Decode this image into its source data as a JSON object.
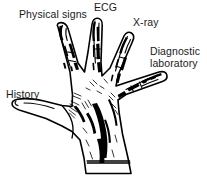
{
  "figure": {
    "name": "diagnostic-hand-diagram",
    "width": 207,
    "height": 176,
    "background_color": "#ffffff",
    "ink_color": "#000000",
    "text_color": "#1a1a1a"
  },
  "labels": [
    {
      "id": "physical-signs",
      "text": "Physical signs",
      "digit": "index-finger"
    },
    {
      "id": "ecg",
      "text": "ECG",
      "digit": "middle-finger"
    },
    {
      "id": "xray",
      "text": "X-ray",
      "digit": "ring-finger"
    },
    {
      "id": "diagnostic-laboratory",
      "text": "Diagnostic\nlaboratory",
      "digit": "little-finger"
    },
    {
      "id": "history",
      "text": "History",
      "digit": "thumb"
    }
  ]
}
